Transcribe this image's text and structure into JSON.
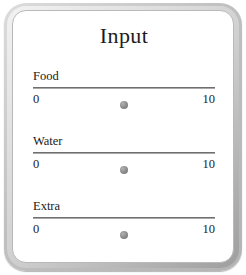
{
  "panel": {
    "title": "Input",
    "frame_color": "#c0c0c0",
    "background_color": "#ffffff",
    "text_color": "#1a1a1a",
    "track_color": "#6f6f6f",
    "handle_color": "#8a8a8a"
  },
  "sliders": [
    {
      "label": "Food",
      "min_label": "0",
      "max_label": "10",
      "min": 0,
      "max": 10,
      "value": 5,
      "handle_percent": 50
    },
    {
      "label": "Water",
      "min_label": "0",
      "max_label": "10",
      "min": 0,
      "max": 10,
      "value": 5,
      "handle_percent": 50
    },
    {
      "label": "Extra",
      "min_label": "0",
      "max_label": "10",
      "min": 0,
      "max": 10,
      "value": 5,
      "handle_percent": 50
    }
  ]
}
